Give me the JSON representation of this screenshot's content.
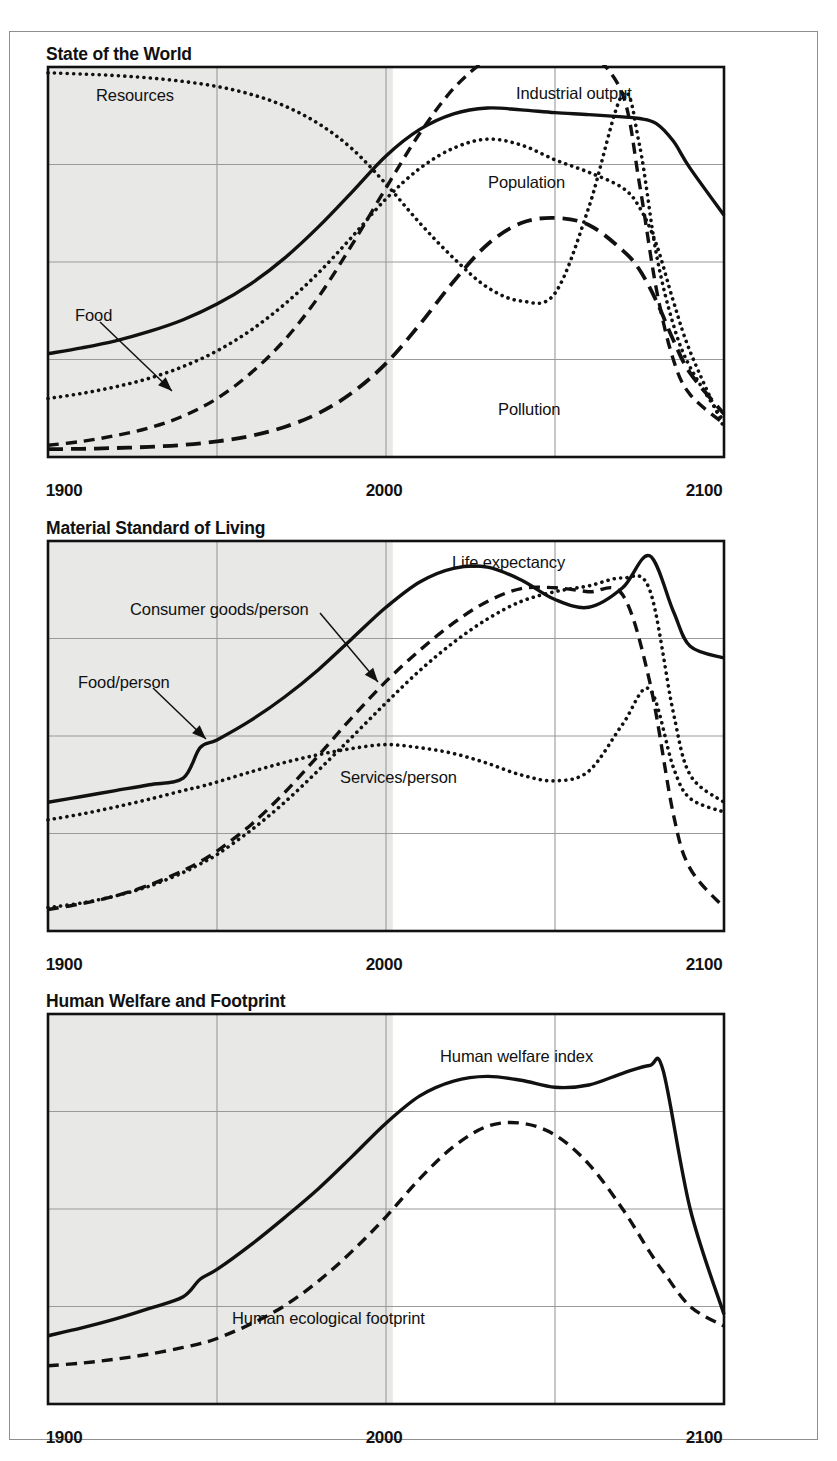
{
  "figure": {
    "background_color": "#ffffff",
    "frame_color": "#8e8e8e",
    "shaded_region_color": "#e8e8e6",
    "gridline_color": "#9a9a9a",
    "axis_color": "#111111",
    "curve_color": "#111111"
  },
  "axis": {
    "xmin": 1900,
    "xmax": 2100,
    "tick_values": [
      1900,
      1950,
      2000,
      2050,
      2100
    ],
    "labeled_ticks": [
      "1900",
      "2000",
      "2100"
    ],
    "gridlines_x": [
      1950,
      2000,
      2050
    ],
    "historical_shading_end": 2002
  },
  "panels": [
    {
      "id": "state-of-the-world",
      "title": "State of the World",
      "gridlines_y_count": 3,
      "labels": [
        {
          "text": "Resources",
          "x": 96,
          "y": 86,
          "arrow": false
        },
        {
          "text": "Industrial output",
          "x": 516,
          "y": 84,
          "arrow": false
        },
        {
          "text": "Population",
          "x": 488,
          "y": 173,
          "arrow": false
        },
        {
          "text": "Food",
          "x": 75,
          "y": 306,
          "arrow": true
        },
        {
          "text": "Pollution",
          "x": 498,
          "y": 400,
          "arrow": false
        }
      ]
    },
    {
      "id": "material-standard-of-living",
      "title": "Material Standard of Living",
      "gridlines_y_count": 3,
      "labels": [
        {
          "text": "Life expectancy",
          "x": 452,
          "y": 553,
          "arrow": false
        },
        {
          "text": "Consumer goods/person",
          "x": 130,
          "y": 600,
          "arrow": true
        },
        {
          "text": "Food/person",
          "x": 78,
          "y": 673,
          "arrow": true
        },
        {
          "text": "Services/person",
          "x": 340,
          "y": 768,
          "arrow": false
        }
      ]
    },
    {
      "id": "human-welfare-and-footprint",
      "title": "Human Welfare and Footprint",
      "gridlines_y_count": 3,
      "labels": [
        {
          "text": "Human welfare index",
          "x": 440,
          "y": 1047,
          "arrow": false
        },
        {
          "text": "Human ecological footprint",
          "x": 232,
          "y": 1309,
          "arrow": false
        }
      ]
    }
  ],
  "chart_data": [
    {
      "type": "line",
      "title": "State of the World",
      "xlabel": "",
      "ylabel": "",
      "xlim": [
        1900,
        2100
      ],
      "ylim": [
        0,
        1
      ],
      "grid": true,
      "legend": "inline-annotations",
      "x": [
        1900,
        1910,
        1920,
        1930,
        1940,
        1950,
        1960,
        1970,
        1980,
        1990,
        2000,
        2010,
        2020,
        2030,
        2040,
        2050,
        2060,
        2070,
        2075,
        2080,
        2085,
        2090,
        2100
      ],
      "series": [
        {
          "name": "Resources",
          "style": "dotted",
          "values": [
            0.985,
            0.982,
            0.978,
            0.972,
            0.963,
            0.95,
            0.93,
            0.9,
            0.855,
            0.79,
            0.7,
            0.6,
            0.51,
            0.435,
            0.4,
            0.42,
            0.64,
            0.93,
            0.8,
            0.52,
            0.34,
            0.23,
            0.09
          ]
        },
        {
          "name": "Industrial output",
          "style": "dashed",
          "values": [
            0.03,
            0.04,
            0.055,
            0.075,
            0.105,
            0.15,
            0.215,
            0.3,
            0.41,
            0.545,
            0.69,
            0.83,
            0.945,
            1.02,
            1.06,
            1.07,
            1.04,
            0.93,
            0.7,
            0.43,
            0.25,
            0.16,
            0.085
          ]
        },
        {
          "name": "Population",
          "style": "solid",
          "values": [
            0.265,
            0.28,
            0.298,
            0.322,
            0.352,
            0.392,
            0.444,
            0.51,
            0.59,
            0.68,
            0.772,
            0.84,
            0.88,
            0.895,
            0.89,
            0.883,
            0.878,
            0.872,
            0.868,
            0.855,
            0.81,
            0.74,
            0.62
          ]
        },
        {
          "name": "Food",
          "style": "dotted",
          "values": [
            0.15,
            0.163,
            0.18,
            0.202,
            0.232,
            0.272,
            0.325,
            0.392,
            0.472,
            0.565,
            0.662,
            0.74,
            0.792,
            0.815,
            0.8,
            0.762,
            0.73,
            0.69,
            0.64,
            0.545,
            0.4,
            0.27,
            0.075
          ]
        },
        {
          "name": "Pollution",
          "style": "long-dashed",
          "values": [
            0.02,
            0.021,
            0.023,
            0.026,
            0.031,
            0.04,
            0.054,
            0.077,
            0.112,
            0.165,
            0.24,
            0.34,
            0.45,
            0.545,
            0.6,
            0.613,
            0.595,
            0.53,
            0.48,
            0.4,
            0.3,
            0.215,
            0.11
          ]
        }
      ]
    },
    {
      "type": "line",
      "title": "Material Standard of Living",
      "xlabel": "",
      "ylabel": "",
      "xlim": [
        1900,
        2100
      ],
      "ylim": [
        0,
        1
      ],
      "grid": true,
      "legend": "inline-annotations",
      "x": [
        1900,
        1910,
        1920,
        1930,
        1940,
        1945,
        1950,
        1960,
        1970,
        1980,
        1990,
        2000,
        2010,
        2020,
        2030,
        2040,
        2050,
        2060,
        2070,
        2078,
        2085,
        2090,
        2100
      ],
      "series": [
        {
          "name": "Life expectancy",
          "style": "solid",
          "values": [
            0.33,
            0.345,
            0.36,
            0.375,
            0.392,
            0.47,
            0.49,
            0.54,
            0.6,
            0.67,
            0.75,
            0.83,
            0.895,
            0.93,
            0.933,
            0.9,
            0.85,
            0.83,
            0.88,
            0.962,
            0.82,
            0.73,
            0.7
          ]
        },
        {
          "name": "Consumer goods/person",
          "style": "dashed",
          "values": [
            0.055,
            0.07,
            0.09,
            0.118,
            0.155,
            0.178,
            0.205,
            0.272,
            0.355,
            0.45,
            0.548,
            0.64,
            0.72,
            0.79,
            0.845,
            0.878,
            0.88,
            0.87,
            0.862,
            0.64,
            0.3,
            0.16,
            0.06
          ]
        },
        {
          "name": "Food/person",
          "style": "dotted",
          "values": [
            0.285,
            0.3,
            0.318,
            0.338,
            0.36,
            0.37,
            0.382,
            0.408,
            0.432,
            0.452,
            0.468,
            0.478,
            0.47,
            0.455,
            0.43,
            0.4,
            0.385,
            0.41,
            0.53,
            0.62,
            0.42,
            0.34,
            0.305
          ]
        },
        {
          "name": "Services/person",
          "style": "dotted",
          "values": [
            0.06,
            0.072,
            0.09,
            0.115,
            0.15,
            0.172,
            0.196,
            0.258,
            0.33,
            0.412,
            0.498,
            0.585,
            0.668,
            0.74,
            0.8,
            0.845,
            0.87,
            0.885,
            0.905,
            0.875,
            0.56,
            0.4,
            0.33
          ]
        }
      ]
    },
    {
      "type": "line",
      "title": "Human Welfare and Footprint",
      "xlabel": "",
      "ylabel": "",
      "xlim": [
        1900,
        2100
      ],
      "ylim": [
        0,
        1
      ],
      "grid": true,
      "legend": "inline-annotations",
      "x": [
        1900,
        1910,
        1920,
        1930,
        1940,
        1945,
        1950,
        1960,
        1970,
        1980,
        1990,
        2000,
        2010,
        2020,
        2030,
        2040,
        2050,
        2060,
        2070,
        2078,
        2082,
        2090,
        2100
      ],
      "series": [
        {
          "name": "Human welfare index",
          "style": "solid",
          "values": [
            0.175,
            0.195,
            0.218,
            0.245,
            0.275,
            0.32,
            0.345,
            0.408,
            0.478,
            0.552,
            0.635,
            0.72,
            0.79,
            0.828,
            0.84,
            0.83,
            0.812,
            0.818,
            0.848,
            0.868,
            0.855,
            0.5,
            0.23
          ]
        },
        {
          "name": "Human ecological footprint",
          "style": "dashed",
          "values": [
            0.098,
            0.105,
            0.115,
            0.128,
            0.145,
            0.155,
            0.168,
            0.205,
            0.252,
            0.315,
            0.392,
            0.48,
            0.578,
            0.66,
            0.712,
            0.72,
            0.69,
            0.615,
            0.5,
            0.39,
            0.34,
            0.25,
            0.2
          ]
        }
      ]
    }
  ]
}
